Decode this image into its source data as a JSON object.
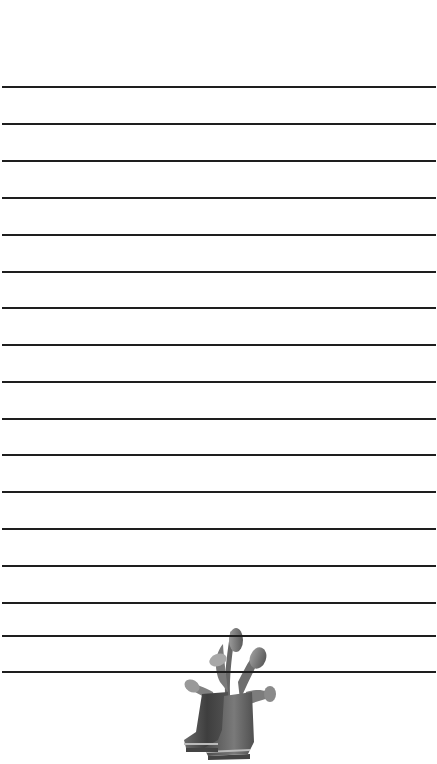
{
  "page": {
    "type": "lined-notepaper",
    "background_color": "#ffffff",
    "line_color": "#1e1e1e",
    "line_positions_y": [
      87,
      124,
      161,
      198,
      235,
      272,
      308,
      345,
      382,
      419,
      455,
      492,
      529,
      566,
      603,
      636,
      672
    ]
  },
  "illustration": {
    "subject": "rubber boots with tulips",
    "style": "grayscale",
    "position": "bottom-center"
  }
}
